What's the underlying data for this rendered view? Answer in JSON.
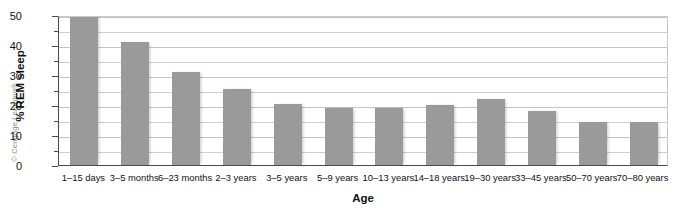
{
  "credit": "© Cengage Learning®",
  "chart_data": {
    "type": "bar",
    "title": "",
    "xlabel": "Age",
    "ylabel": "% REM sleep",
    "ylim": [
      0,
      50
    ],
    "yticks": [
      0,
      10,
      20,
      30,
      40,
      50
    ],
    "ytick_labels": [
      "0",
      "10",
      "20",
      "30",
      "40",
      "50"
    ],
    "minor_gridlines": [
      5,
      15,
      25,
      35,
      45
    ],
    "grid": true,
    "legend": "none",
    "bar_color": "#9a9a9a",
    "categories": [
      "1–15 days",
      "3–5 months",
      "6–23 months",
      "2–3 years",
      "3–5 years",
      "5–9 years",
      "10–13 years",
      "14–18 years",
      "19–30 years",
      "33–45 years",
      "50–70 years",
      "70–80 years"
    ],
    "values": [
      50,
      41,
      31,
      25.5,
      20.5,
      19,
      19,
      20,
      22,
      18,
      14.5,
      14.5
    ]
  }
}
